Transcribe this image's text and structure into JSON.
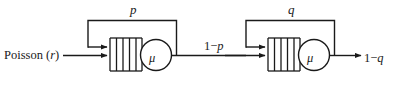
{
  "diagram": {
    "type": "queueing-network",
    "canvas": {
      "width": 398,
      "height": 87,
      "background": "#ffffff"
    },
    "stroke_color": "#1a1a1a",
    "text_color": "#1a1a1a",
    "source": {
      "label_prefix": "Poisson (",
      "label_rate": "r",
      "label_suffix": ")",
      "label_full": "Poisson (r)"
    },
    "stage1": {
      "feedback_label": "p",
      "server_label": "μ",
      "buffer_slots": 5,
      "queue_name": "queue-1",
      "server_name": "server-1"
    },
    "link_1_to_2": {
      "label_prefix": "1−",
      "label_var": "p",
      "label_full": "1−p"
    },
    "stage2": {
      "feedback_label": "q",
      "server_label": "μ",
      "buffer_slots": 5,
      "queue_name": "queue-2",
      "server_name": "server-2"
    },
    "departure": {
      "label_prefix": "1−",
      "label_var": "q",
      "label_full": "1−q"
    }
  }
}
